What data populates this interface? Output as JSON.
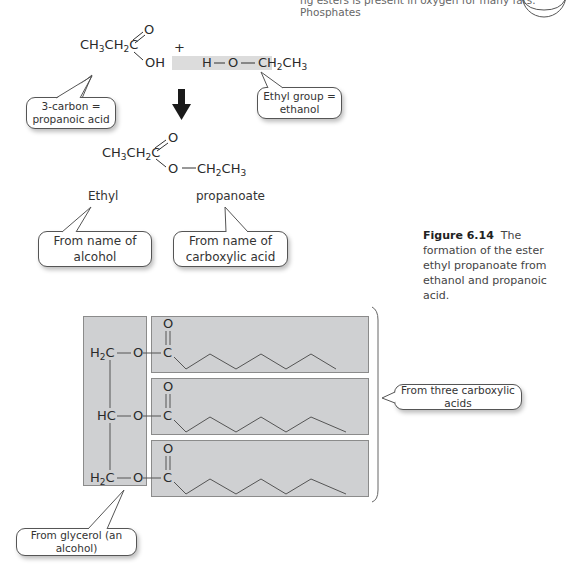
{
  "header": {
    "running_text": "ng esters is present in oxygen for many fats. Phosphates",
    "page_circle": ""
  },
  "reaction": {
    "acid_formula": "CH3CH2C",
    "acid_oh": "OH",
    "acid_o": "O",
    "plus": "+",
    "alcohol_h": "H",
    "alcohol_o": "O",
    "alcohol_rest": "CH2CH3",
    "bubble_acid": [
      "3-carbon =",
      "propanoic acid"
    ],
    "bubble_alcohol": [
      "Ethyl group =",
      "ethanol"
    ],
    "product_formula": "CH3CH2C",
    "product_o_double": "O",
    "product_o_single": "O",
    "product_rest": "CH2CH3",
    "name_part1": "Ethyl",
    "name_part2": "propanoate",
    "bubble_name1": [
      "From name of",
      "alcohol"
    ],
    "bubble_name2": [
      "From name of",
      "carboxylic acid"
    ]
  },
  "caption": {
    "figure_label": "Figure 6.14",
    "text": "The formation of the ester ethyl propanoate from ethanol and propanoic acid."
  },
  "triglyceride": {
    "rows": [
      {
        "left": "H2C",
        "o": "O",
        "c": "C",
        "carbonyl": "O"
      },
      {
        "left": "HC",
        "o": "O",
        "c": "C",
        "carbonyl": "O"
      },
      {
        "left": "H2C",
        "o": "O",
        "c": "C",
        "carbonyl": "O"
      }
    ],
    "bubble_acids": "From three carboxylic acids",
    "bubble_glycerol": "From glycerol (an alcohol)"
  },
  "colors": {
    "box_fill": "#cfd0d2",
    "box_border": "#8b8b8b",
    "highlight_bar": "#dcdcdc",
    "text": "#333333"
  }
}
